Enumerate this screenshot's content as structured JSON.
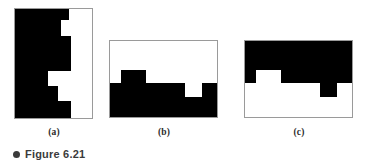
{
  "figure": {
    "caption_bullet": "bullet-dot",
    "caption_text": "Figure 6.21",
    "background_color": "#ffffff",
    "fill_color": "#000000",
    "border_color": "#9a9a9a",
    "label_color": "#2b2b2b",
    "caption_color": "#3b3b3b"
  },
  "panels": [
    {
      "id": "a",
      "label": "(a)",
      "orientation": "vertical",
      "width": 79,
      "height": 111,
      "description": "Black stepped region occupying the left portion of a tall rectangle; white region on the right",
      "black_polygon": "0,0 55,0 55,12 47,12 47,28 57,28 57,63 34,63 34,78 44,78 44,93 57,93 57,111 0,111"
    },
    {
      "id": "b",
      "label": "(b)",
      "orientation": "horizontal",
      "width": 109,
      "height": 78,
      "description": "White upper region with black lower region; black has a raised block at left and a notch dipping down toward the right",
      "black_polygon": "0,43 12,43 12,30 37,30 37,43 76,43 76,57 93,57 93,43 109,43 109,78 0,78"
    },
    {
      "id": "c",
      "label": "(c)",
      "orientation": "horizontal",
      "width": 109,
      "height": 78,
      "description": "Inverse of panel b: black upper region with white lower region; white has a raised block at left and a notch dipping down toward the right",
      "black_polygon": "0,0 109,0 109,43 93,43 93,57 76,57 76,43 37,43 37,30 12,30 12,43 0,43"
    }
  ]
}
